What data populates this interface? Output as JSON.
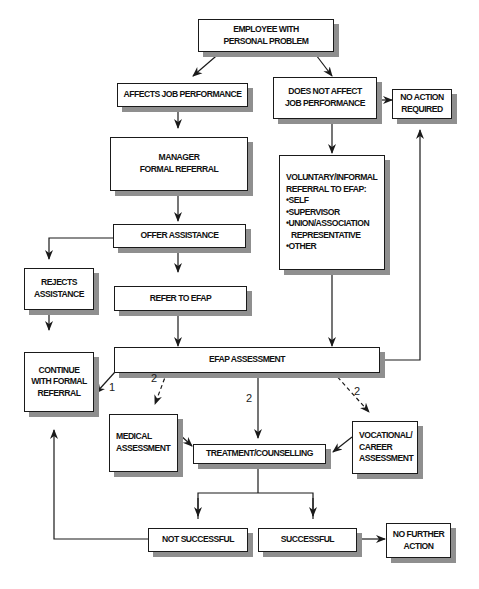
{
  "diagram": {
    "nodes": {
      "employee": [
        "EMPLOYEE WITH",
        "PERSONAL PROBLEM"
      ],
      "affects": [
        "AFFECTS JOB PERFORMANCE"
      ],
      "not_affects": [
        "DOES NOT AFFECT",
        "JOB PERFORMANCE"
      ],
      "no_action": [
        "NO ACTION",
        "REQUIRED"
      ],
      "manager": [
        "MANAGER",
        "FORMAL REFERRAL"
      ],
      "voluntary": [
        "VOLUNTARY/INFORMAL",
        "REFERRAL TO EFAP:",
        "•SELF",
        "•SUPERVISOR",
        "•UNION/ASSOCIATION",
        "  REPRESENTATIVE",
        "•OTHER"
      ],
      "offer": [
        "OFFER ASSISTANCE"
      ],
      "rejects": [
        "REJECTS",
        "ASSISTANCE"
      ],
      "refer": [
        "REFER TO EFAP"
      ],
      "continue": [
        "CONTINUE",
        "WITH FORMAL",
        "REFERRAL"
      ],
      "efap": [
        "EFAP ASSESSMENT"
      ],
      "medical": [
        "MEDICAL",
        "ASSESSMENT"
      ],
      "treatment": [
        "TREATMENT/COUNSELLING"
      ],
      "vocational": [
        "VOCATIONAL/",
        "CAREER",
        "ASSESSMENT"
      ],
      "not_successful": [
        "NOT SUCCESSFUL"
      ],
      "successful": [
        "SUCCESSFUL"
      ],
      "no_further": [
        "NO FURTHER",
        "ACTION"
      ]
    },
    "edge_labels": {
      "to_continue": "1",
      "to_medical": "2",
      "to_treatment": "2",
      "to_vocational": "2"
    },
    "colors": {
      "line": "#1a1a1a",
      "shadow": "#8f8f8f",
      "background": "#ffffff"
    }
  }
}
